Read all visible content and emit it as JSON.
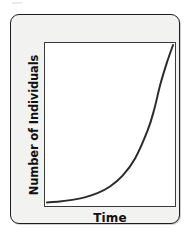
{
  "figure": {
    "kind": "exponential-growth-curve",
    "frame_fill": "#f2f2f0",
    "frame_border": "#1d1d1d",
    "plot_fill": "#ffffff",
    "plot_border": "#3a3a3a"
  },
  "chart_data": {
    "type": "line",
    "title": "",
    "subtitle": "",
    "xlabel": "Time",
    "ylabel": "Number of Individuals",
    "grid": false,
    "legend": null,
    "legend_position": "none",
    "axis_tick_labels_x": [],
    "axis_tick_labels_y": [],
    "xlim": [
      0,
      10
    ],
    "ylim": [
      0,
      100
    ],
    "line_color": "#2b2b2b",
    "line_width": 2,
    "annotations": [],
    "series": [
      {
        "name": "Population",
        "x": [
          0,
          1,
          2,
          3,
          4,
          5,
          6,
          7,
          8,
          8.5,
          9,
          9.5,
          10
        ],
        "values": [
          1,
          1.6,
          2.6,
          4.2,
          6.8,
          11,
          17.8,
          28.8,
          46.6,
          59.3,
          75.4,
          88.6,
          100
        ]
      }
    ]
  },
  "labels": {
    "y_axis": "Number of Individuals",
    "x_axis": "Time"
  }
}
